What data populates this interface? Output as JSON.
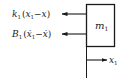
{
  "diagram": {
    "type": "free-body-diagram",
    "mass": {
      "label": "m",
      "subscript": "1"
    },
    "forces": [
      {
        "id": "spring",
        "coef": "k",
        "coef_sub": "1",
        "expr_open": "(",
        "var1": "x",
        "var1_sub": "1",
        "op": "−",
        "var2": "x",
        "expr_close": ")",
        "direction": "left"
      },
      {
        "id": "damper",
        "coef": "B",
        "coef_sub": "1",
        "expr_open": "(",
        "var1": "ẋ",
        "var1_sub": "1",
        "op": "−",
        "var2": "ẋ",
        "expr_close": ")",
        "direction": "left"
      }
    ],
    "displacement": {
      "label": "x",
      "subscript": "1",
      "direction": "right"
    },
    "colors": {
      "stroke": "#1a1a1a",
      "background": "#ffffff"
    }
  }
}
